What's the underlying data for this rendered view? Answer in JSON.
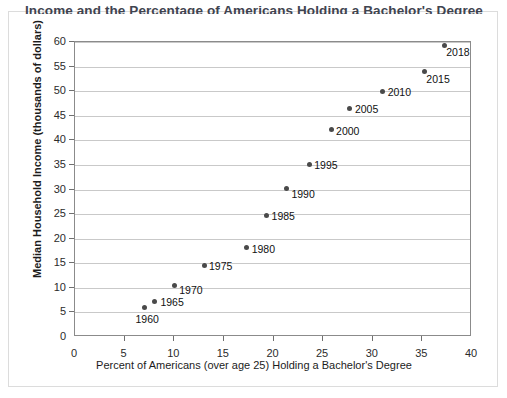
{
  "chart_data": {
    "type": "scatter",
    "title": "Income and the Percentage of Americans Holding a Bachelor's Degree",
    "xlabel": "Percent of Americans (over age 25) Holding a Bachelor's Degree",
    "ylabel": "Median Household Income (thousands of dollars)",
    "xlim": [
      0,
      40
    ],
    "ylim": [
      0,
      60
    ],
    "xticks": [
      0,
      5,
      10,
      15,
      20,
      25,
      30,
      35,
      40
    ],
    "yticks": [
      0,
      5,
      10,
      15,
      20,
      25,
      30,
      35,
      40,
      45,
      50,
      55,
      60
    ],
    "xtick_labels": [
      "0",
      "5",
      "10",
      "15",
      "20",
      "25",
      "30",
      "35",
      "40"
    ],
    "ytick_labels": [
      "0",
      "5",
      "10",
      "15",
      "20",
      "25",
      "30",
      "35",
      "40",
      "45",
      "50",
      "55",
      "60"
    ],
    "grid": "horizontal",
    "legend": "none",
    "point_color": "#4a4a4a",
    "grid_color": "#c9c9c9",
    "axis_color": "#8b8b8b",
    "points": [
      {
        "label": "1960",
        "x": 7.0,
        "y": 6.0,
        "label_dx": -9,
        "label_dy": 11
      },
      {
        "label": "1965",
        "x": 8.0,
        "y": 7.3,
        "label_dx": 6,
        "label_dy": 1
      },
      {
        "label": "1970",
        "x": 10.0,
        "y": 10.5,
        "label_dx": 5,
        "label_dy": 5
      },
      {
        "label": "1975",
        "x": 13.0,
        "y": 14.6,
        "label_dx": 5,
        "label_dy": 1
      },
      {
        "label": "1980",
        "x": 17.3,
        "y": 18.2,
        "label_dx": 5,
        "label_dy": 1
      },
      {
        "label": "1985",
        "x": 19.3,
        "y": 24.8,
        "label_dx": 5,
        "label_dy": 1
      },
      {
        "label": "1990",
        "x": 21.3,
        "y": 30.2,
        "label_dx": 5,
        "label_dy": 5
      },
      {
        "label": "1995",
        "x": 23.6,
        "y": 35.1,
        "label_dx": 5,
        "label_dy": 1
      },
      {
        "label": "2000",
        "x": 25.8,
        "y": 42.2,
        "label_dx": 5,
        "label_dy": 1
      },
      {
        "label": "2005",
        "x": 27.7,
        "y": 46.5,
        "label_dx": 5,
        "label_dy": 1
      },
      {
        "label": "2010",
        "x": 31.0,
        "y": 50.0,
        "label_dx": 5,
        "label_dy": 1
      },
      {
        "label": "2015",
        "x": 35.2,
        "y": 54.0,
        "label_dx": 2,
        "label_dy": 7
      },
      {
        "label": "2018",
        "x": 37.2,
        "y": 59.3,
        "label_dx": 2,
        "label_dy": 7
      }
    ]
  }
}
